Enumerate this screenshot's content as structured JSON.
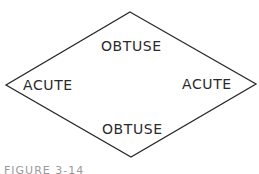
{
  "diagram": {
    "shape": "rhombus",
    "stroke_color": "#2a2a2a",
    "vertices": {
      "top": [
        130,
        12
      ],
      "right": [
        256,
        84
      ],
      "bottom": [
        131,
        157
      ],
      "left": [
        6,
        85
      ]
    },
    "labels": {
      "top_angle": "OBTUSE",
      "bottom_angle": "OBTUSE",
      "left_angle": "ACUTE",
      "right_angle": "ACUTE"
    }
  },
  "caption": {
    "text": "FIGURE 3-14"
  }
}
